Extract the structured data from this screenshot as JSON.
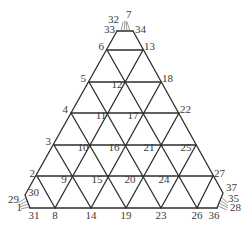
{
  "diagram": {
    "type": "triangular-mesh",
    "line_color": "#2e2e2e",
    "label_color": "#3a3a3a",
    "nodes": [
      {
        "id": "1",
        "x": 22,
        "y": 211,
        "anchor": "end"
      },
      {
        "id": "2",
        "x": 35,
        "y": 177,
        "anchor": "end"
      },
      {
        "id": "3",
        "x": 51,
        "y": 145,
        "anchor": "end"
      },
      {
        "id": "4",
        "x": 68,
        "y": 113,
        "anchor": "end"
      },
      {
        "id": "5",
        "x": 86,
        "y": 82,
        "anchor": "end"
      },
      {
        "id": "6",
        "x": 104,
        "y": 50,
        "anchor": "end"
      },
      {
        "id": "7",
        "x": 126,
        "y": 18,
        "anchor": "start"
      },
      {
        "id": "8",
        "x": 55,
        "y": 219,
        "anchor": "middle"
      },
      {
        "id": "9",
        "x": 64,
        "y": 183,
        "anchor": "middle"
      },
      {
        "id": "10",
        "x": 83,
        "y": 151,
        "anchor": "middle"
      },
      {
        "id": "11",
        "x": 101,
        "y": 119,
        "anchor": "middle"
      },
      {
        "id": "12",
        "x": 117,
        "y": 88,
        "anchor": "middle"
      },
      {
        "id": "13",
        "x": 144,
        "y": 50,
        "anchor": "start"
      },
      {
        "id": "14",
        "x": 91,
        "y": 219,
        "anchor": "middle"
      },
      {
        "id": "15",
        "x": 97,
        "y": 183,
        "anchor": "middle"
      },
      {
        "id": "16",
        "x": 114,
        "y": 151,
        "anchor": "middle"
      },
      {
        "id": "17",
        "x": 133,
        "y": 119,
        "anchor": "middle"
      },
      {
        "id": "18",
        "x": 162,
        "y": 82,
        "anchor": "start"
      },
      {
        "id": "19",
        "x": 126,
        "y": 219,
        "anchor": "middle"
      },
      {
        "id": "20",
        "x": 130,
        "y": 183,
        "anchor": "middle"
      },
      {
        "id": "21",
        "x": 149,
        "y": 151,
        "anchor": "middle"
      },
      {
        "id": "22",
        "x": 180,
        "y": 113,
        "anchor": "start"
      },
      {
        "id": "23",
        "x": 161,
        "y": 219,
        "anchor": "middle"
      },
      {
        "id": "24",
        "x": 164,
        "y": 183,
        "anchor": "middle"
      },
      {
        "id": "25",
        "x": 186,
        "y": 151,
        "anchor": "middle"
      },
      {
        "id": "26",
        "x": 197,
        "y": 219,
        "anchor": "middle"
      },
      {
        "id": "27",
        "x": 214,
        "y": 177,
        "anchor": "start"
      },
      {
        "id": "28",
        "x": 230,
        "y": 211,
        "anchor": "start"
      },
      {
        "id": "29",
        "x": 19,
        "y": 203,
        "anchor": "end"
      },
      {
        "id": "30",
        "x": 28,
        "y": 196,
        "anchor": "start"
      },
      {
        "id": "31",
        "x": 34,
        "y": 219,
        "anchor": "middle"
      },
      {
        "id": "32",
        "x": 119,
        "y": 23,
        "anchor": "end"
      },
      {
        "id": "33",
        "x": 115,
        "y": 33,
        "anchor": "end"
      },
      {
        "id": "34",
        "x": 135,
        "y": 33,
        "anchor": "start"
      },
      {
        "id": "35",
        "x": 228,
        "y": 202,
        "anchor": "start"
      },
      {
        "id": "36",
        "x": 214,
        "y": 219,
        "anchor": "middle"
      },
      {
        "id": "37",
        "x": 226,
        "y": 191,
        "anchor": "start"
      }
    ]
  }
}
